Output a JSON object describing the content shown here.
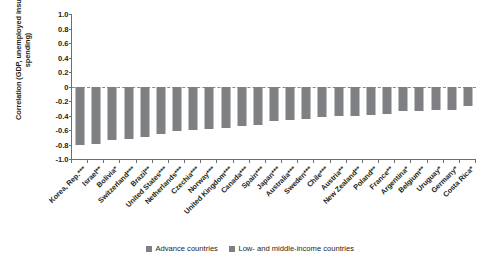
{
  "chart_data": {
    "type": "bar",
    "title": "",
    "xlabel": "",
    "ylabel": "Correlation (GDP, unemployed insurance spending)",
    "ylim": [
      -1.0,
      1.0
    ],
    "grid": false,
    "zero_line": true,
    "legend_position": "bottom",
    "categories": [
      "Korea, Rep.***",
      "Israel**",
      "Bolivia*",
      "Switzerland***",
      "Brazil**",
      "United States***",
      "Netherlands***",
      "Czechia***",
      "Norway***",
      "United Kingdom***",
      "Canada***",
      "Spain***",
      "Japan***",
      "Australia***",
      "Sweden***",
      "Chile***",
      "Austria**",
      "New Zealand**",
      "Poland**",
      "France**",
      "Argentina*",
      "Belgium**",
      "Uruguay*",
      "Germany*",
      "Costa Rica*"
    ],
    "values": [
      -0.8,
      -0.79,
      -0.74,
      -0.73,
      -0.69,
      -0.65,
      -0.61,
      -0.6,
      -0.59,
      -0.57,
      -0.55,
      -0.53,
      -0.47,
      -0.46,
      -0.45,
      -0.42,
      -0.41,
      -0.41,
      -0.39,
      -0.38,
      -0.34,
      -0.34,
      -0.33,
      -0.33,
      -0.27
    ],
    "y_ticks": [
      "1.0",
      "0.8",
      "0.6",
      "0.4",
      "0.2",
      "0",
      "-0.2",
      "-0.4",
      "-0.6",
      "-0.8",
      "-1.0"
    ],
    "y_tick_values": [
      1.0,
      0.8,
      0.6,
      0.4,
      0.2,
      0,
      -0.2,
      -0.4,
      -0.6,
      -0.8,
      -1.0
    ],
    "series": [
      {
        "name": "Advance countries",
        "color": "#7f8083"
      },
      {
        "name": "Low- and middle-income countries",
        "color": "#7f8083"
      }
    ],
    "legend": [
      "Advance countries",
      "Low- and middle-income countries"
    ],
    "bar_color": "#7f8083",
    "axis_color": "#6d6e71"
  }
}
